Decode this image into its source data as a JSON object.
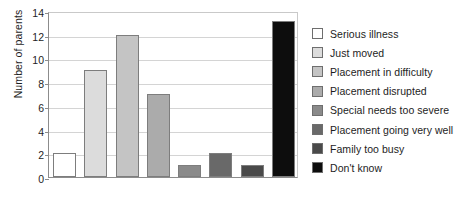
{
  "chart_data": {
    "type": "bar",
    "title": "",
    "xlabel": "",
    "ylabel": "Number of parents",
    "ylim": [
      0,
      14
    ],
    "ytick_step": 2,
    "yticks": [
      0,
      2,
      4,
      6,
      8,
      10,
      12,
      14
    ],
    "grid": true,
    "legend_position": "right",
    "categories": [
      "Serious illness",
      "Just moved",
      "Placement in difficulty",
      "Placement disrupted",
      "Special needs too severe",
      "Placement going very well",
      "Family too busy",
      "Don't know"
    ],
    "values": [
      2,
      9,
      12,
      7,
      1,
      2,
      1,
      13.2
    ],
    "colors": [
      "#ffffff",
      "#dcdcdc",
      "#c4c4c4",
      "#ababab",
      "#8a8a8a",
      "#696969",
      "#4a4a4a",
      "#0d0d0d"
    ]
  },
  "legend": {
    "items": [
      {
        "label": "Serious illness",
        "color": "#ffffff"
      },
      {
        "label": "Just moved",
        "color": "#dcdcdc"
      },
      {
        "label": "Placement in difficulty",
        "color": "#c4c4c4"
      },
      {
        "label": "Placement disrupted",
        "color": "#ababab"
      },
      {
        "label": "Special needs too severe",
        "color": "#8a8a8a"
      },
      {
        "label": "Placement going very well",
        "color": "#696969"
      },
      {
        "label": "Family too busy",
        "color": "#4a4a4a"
      },
      {
        "label": "Don't know",
        "color": "#0d0d0d"
      }
    ]
  }
}
